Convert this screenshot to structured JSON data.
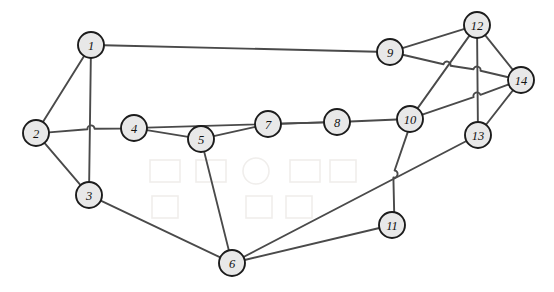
{
  "figure": {
    "kind": "undirected-graph-diagram",
    "title": "",
    "background_color": "#ffffff",
    "width": 554,
    "height": 292
  },
  "style": {
    "node_fill": "#e8e8e8",
    "node_stroke": "#1c1c1c",
    "edge_color": "#4a4a4a",
    "label_color": "#111111",
    "node_radius": 13,
    "edge_width": 1.9
  },
  "chart_data": {
    "type": "graph",
    "node_count": 14,
    "edge_count": 22,
    "nodes": [
      {
        "id": 1,
        "label": "1",
        "x": 91,
        "y": 45
      },
      {
        "id": 2,
        "label": "2",
        "x": 36,
        "y": 133
      },
      {
        "id": 3,
        "label": "3",
        "x": 89,
        "y": 195
      },
      {
        "id": 4,
        "label": "4",
        "x": 134,
        "y": 128
      },
      {
        "id": 5,
        "label": "5",
        "x": 201,
        "y": 139
      },
      {
        "id": 6,
        "label": "6",
        "x": 232,
        "y": 263
      },
      {
        "id": 7,
        "label": "7",
        "x": 268,
        "y": 124
      },
      {
        "id": 8,
        "label": "8",
        "x": 337,
        "y": 122
      },
      {
        "id": 9,
        "label": "9",
        "x": 390,
        "y": 52
      },
      {
        "id": 10,
        "label": "10",
        "x": 410,
        "y": 119
      },
      {
        "id": 11,
        "label": "11",
        "x": 392,
        "y": 225
      },
      {
        "id": 12,
        "label": "12",
        "x": 477,
        "y": 25
      },
      {
        "id": 13,
        "label": "13",
        "x": 478,
        "y": 135
      },
      {
        "id": 14,
        "label": "14",
        "x": 521,
        "y": 80
      }
    ],
    "edges": [
      {
        "source": 1,
        "target": 2
      },
      {
        "source": 1,
        "target": 3
      },
      {
        "source": 1,
        "target": 9
      },
      {
        "source": 2,
        "target": 3
      },
      {
        "source": 2,
        "target": 4
      },
      {
        "source": 3,
        "target": 6
      },
      {
        "source": 4,
        "target": 5
      },
      {
        "source": 4,
        "target": 8
      },
      {
        "source": 5,
        "target": 6
      },
      {
        "source": 5,
        "target": 7
      },
      {
        "source": 7,
        "target": 8
      },
      {
        "source": 8,
        "target": 10
      },
      {
        "source": 9,
        "target": 12
      },
      {
        "source": 9,
        "target": 14
      },
      {
        "source": 6,
        "target": 11
      },
      {
        "source": 6,
        "target": 13
      },
      {
        "source": 10,
        "target": 11
      },
      {
        "source": 10,
        "target": 12
      },
      {
        "source": 10,
        "target": 14
      },
      {
        "source": 12,
        "target": 13
      },
      {
        "source": 12,
        "target": 14
      },
      {
        "source": 13,
        "target": 14
      }
    ],
    "crossing_hops": [
      {
        "x": 91,
        "y": 129,
        "note": "edge 2-4 hops over edge 1-3"
      },
      {
        "x": 243,
        "y": 88,
        "note": "edge 4-8 hops over edge 1-9"
      },
      {
        "x": 447,
        "y": 65,
        "note": "edge 9-14 hops over edge 10-12"
      },
      {
        "x": 477,
        "y": 70,
        "note": "edge 9-14 hops over edge 12-13"
      },
      {
        "x": 477,
        "y": 96,
        "note": "edge 10-14 hops over edge 12-13"
      },
      {
        "x": 394,
        "y": 174,
        "note": "edge 10-11 hops over edge 6-13"
      }
    ]
  }
}
